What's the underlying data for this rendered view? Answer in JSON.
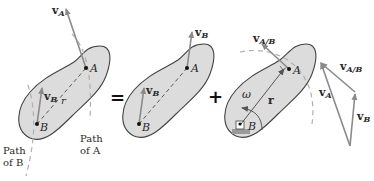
{
  "diagram": {
    "type": "rigid-body-relative-velocity",
    "operators": {
      "equals": "=",
      "plus": "+"
    },
    "colors": {
      "body_fill": "#dcdcdc",
      "body_stroke": "#444444",
      "vector": "#8a8a8a",
      "path_dashed": "#b0b0b0",
      "text": "#2a2a2a"
    },
    "panels": [
      {
        "id": "general-motion",
        "labels": {
          "point_a": "A",
          "point_b": "B",
          "vel_a_main": "v",
          "vel_a_sub": "A",
          "vel_b_main": "v",
          "vel_b_sub": "B",
          "radius": "r",
          "path_b_line1": "Path",
          "path_b_line2": "of B",
          "path_a_line1": "Path",
          "path_a_line2": "of A"
        }
      },
      {
        "id": "translation",
        "labels": {
          "point_a": "A",
          "point_b": "B",
          "vel_a_main": "v",
          "vel_a_sub": "B",
          "vel_b_main": "v",
          "vel_b_sub": "B"
        }
      },
      {
        "id": "rotation-about-b",
        "labels": {
          "point_a": "A",
          "point_b": "B",
          "vel_ab_main": "v",
          "vel_ab_sub": "A/B",
          "omega": "ω",
          "radius": "r"
        }
      },
      {
        "id": "vector-triangle",
        "labels": {
          "vel_a_main": "v",
          "vel_a_sub": "A",
          "vel_ab_main": "v",
          "vel_ab_sub": "A/B",
          "vel_b_main": "v",
          "vel_b_sub": "B"
        }
      }
    ]
  }
}
